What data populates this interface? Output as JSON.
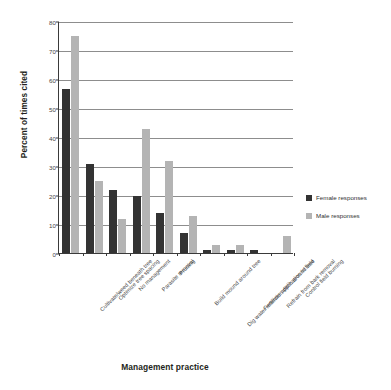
{
  "chart_data": {
    "type": "bar",
    "title": "",
    "xlabel": "Management practice",
    "ylabel": "Percent of times cited",
    "ylim": [
      0,
      80
    ],
    "yticks": [
      0,
      10,
      20,
      30,
      40,
      50,
      60,
      70,
      80
    ],
    "grid": true,
    "legend_position": "right",
    "categories": [
      "Cultivate/weed beneath tree",
      "Optimize tree spacing",
      "No management",
      "Parasite removal",
      "Pruning",
      "Build mound around tree",
      "Dig water retention ditch around tree",
      "Fertilizer application in field",
      "Refrain from bark removal",
      "Control field burning"
    ],
    "series": [
      {
        "name": "Female responses",
        "color": "#333333",
        "values": [
          56.5,
          30.8,
          21.7,
          19.8,
          13.9,
          6.9,
          1.0,
          1.0,
          1.0,
          0
        ]
      },
      {
        "name": "Male responses",
        "color": "#b4b4b4",
        "values": [
          75.0,
          24.8,
          11.6,
          42.6,
          31.7,
          12.9,
          2.8,
          2.8,
          0,
          5.9
        ]
      }
    ]
  }
}
